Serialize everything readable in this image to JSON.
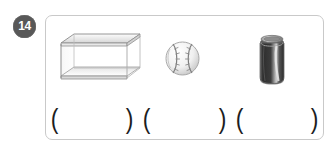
{
  "question": {
    "number": "14",
    "badge_color": "#585858",
    "panel_border_color": "#c9c9c9"
  },
  "figures": [
    {
      "id": "glass-box",
      "label": "rectangular glass box",
      "fill": "#f2f2f2",
      "stroke": "#8a8a8a"
    },
    {
      "id": "baseball",
      "label": "baseball",
      "fill": "#f7f7f7",
      "stroke": "#9a9a9a"
    },
    {
      "id": "soda-can",
      "label": "soda can",
      "fill": "#3a3a3a",
      "stroke": "#8e8e8e"
    }
  ],
  "answers": [
    {
      "open": "(",
      "close": ")",
      "value": ""
    },
    {
      "open": "(",
      "close": ")",
      "value": ""
    },
    {
      "open": "(",
      "close": ")",
      "value": ""
    }
  ]
}
